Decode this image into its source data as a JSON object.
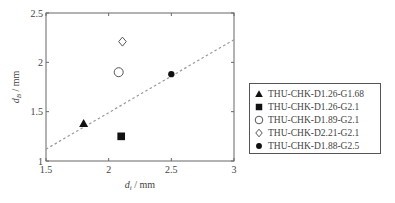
{
  "chart_data": {
    "type": "scatter",
    "title": "",
    "xlabel": "d_i / mm",
    "ylabel": "d_B / mm",
    "xlabel_main": "d",
    "xlabel_sub": "i",
    "xlabel_unit": " / mm",
    "ylabel_main": "d",
    "ylabel_sub": "B",
    "ylabel_unit": " / mm",
    "xlim": [
      1.5,
      3
    ],
    "ylim": [
      1,
      2.5
    ],
    "xticks": [
      1.5,
      2,
      2.5,
      3
    ],
    "yticks": [
      1,
      1.5,
      2,
      2.5
    ],
    "xtick_labels": [
      "1.5",
      "2",
      "2.5",
      "3"
    ],
    "ytick_labels": [
      "1",
      "1.5",
      "2",
      "2.5"
    ],
    "grid": false,
    "legend_position": "right-outside",
    "series": [
      {
        "name": "THU-CHK-D1.26-G1.68",
        "marker": "triangle-filled",
        "x": [
          1.8
        ],
        "y": [
          1.38
        ]
      },
      {
        "name": "THU-CHK-D1.26-G2.1",
        "marker": "square-filled",
        "x": [
          2.1
        ],
        "y": [
          1.25
        ]
      },
      {
        "name": "THU-CHK-D1.89-G2.1",
        "marker": "circle-open",
        "x": [
          2.08
        ],
        "y": [
          1.9
        ]
      },
      {
        "name": "THU-CHK-D2.21-G2.1",
        "marker": "diamond-open",
        "x": [
          2.11
        ],
        "y": [
          2.21
        ]
      },
      {
        "name": "THU-CHK-D1.88-G2.5",
        "marker": "circle-filled",
        "x": [
          2.5
        ],
        "y": [
          1.88
        ]
      }
    ],
    "fit_line": {
      "style": "dashed",
      "x": [
        1.5,
        3
      ],
      "y": [
        1.12,
        2.23
      ]
    }
  },
  "colors": {
    "axis": "#666666",
    "marker": "#111111",
    "fit_line": "#999999",
    "text": "#444444"
  }
}
